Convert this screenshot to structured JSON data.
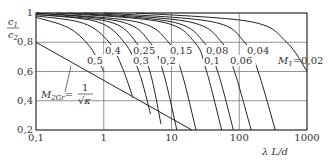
{
  "chart_data": {
    "type": "line",
    "title": "",
    "xlabel": "λ L/d",
    "ylabel": "c1/c2",
    "xscale": "log",
    "xlim": [
      0.1,
      1000
    ],
    "ylim": [
      0.2,
      1.0
    ],
    "grid": true,
    "x_ticks": [
      "0,1",
      "1",
      "10",
      "100",
      "1000"
    ],
    "y_ticks": [
      "0,2",
      "0,4",
      "0,6",
      "0,8",
      "1"
    ],
    "boundary_line": {
      "name": "M2Gr = 1/√κ",
      "points": [
        [
          0.1,
          0.8
        ],
        [
          20,
          0.2
        ]
      ]
    },
    "series": [
      {
        "name": "0,5",
        "M1": 0.5,
        "points": [
          [
            0.1,
            0.97
          ],
          [
            0.3,
            0.9
          ],
          [
            0.6,
            0.78
          ],
          [
            0.9,
            0.64
          ],
          [
            1.0,
            0.6
          ]
        ]
      },
      {
        "name": "0,4",
        "M1": 0.4,
        "points": [
          [
            0.1,
            0.98
          ],
          [
            0.5,
            0.93
          ],
          [
            1.2,
            0.8
          ],
          [
            1.9,
            0.62
          ],
          [
            2.7,
            0.42
          ]
        ]
      },
      {
        "name": "0,3",
        "M1": 0.3,
        "points": [
          [
            0.1,
            0.99
          ],
          [
            0.8,
            0.94
          ],
          [
            2.0,
            0.8
          ],
          [
            3.3,
            0.6
          ],
          [
            4.9,
            0.31
          ]
        ]
      },
      {
        "name": "0,25",
        "M1": 0.25,
        "points": [
          [
            0.1,
            0.99
          ],
          [
            1.2,
            0.94
          ],
          [
            3.0,
            0.8
          ],
          [
            4.8,
            0.6
          ],
          [
            7.0,
            0.24
          ]
        ]
      },
      {
        "name": "0,2",
        "M1": 0.2,
        "points": [
          [
            0.1,
            1.0
          ],
          [
            1.8,
            0.94
          ],
          [
            4.8,
            0.8
          ],
          [
            7.5,
            0.6
          ],
          [
            12,
            0.2
          ]
        ]
      },
      {
        "name": "0,15",
        "M1": 0.15,
        "points": [
          [
            0.1,
            1.0
          ],
          [
            3.0,
            0.94
          ],
          [
            9.0,
            0.8
          ],
          [
            14,
            0.6
          ],
          [
            23,
            0.2
          ]
        ]
      },
      {
        "name": "0,1",
        "M1": 0.1,
        "points": [
          [
            0.2,
            1.0
          ],
          [
            7.0,
            0.94
          ],
          [
            22,
            0.8
          ],
          [
            33,
            0.6
          ],
          [
            55,
            0.2
          ]
        ]
      },
      {
        "name": "0,08",
        "M1": 0.08,
        "points": [
          [
            0.3,
            1.0
          ],
          [
            10,
            0.94
          ],
          [
            30,
            0.8
          ],
          [
            48,
            0.6
          ],
          [
            82,
            0.2
          ]
        ]
      },
      {
        "name": "0,06",
        "M1": 0.06,
        "points": [
          [
            0.5,
            1.0
          ],
          [
            18,
            0.94
          ],
          [
            55,
            0.8
          ],
          [
            85,
            0.6
          ],
          [
            150,
            0.2
          ]
        ]
      },
      {
        "name": "0,04",
        "M1": 0.04,
        "points": [
          [
            1.0,
            1.0
          ],
          [
            40,
            0.94
          ],
          [
            120,
            0.8
          ],
          [
            190,
            0.6
          ],
          [
            340,
            0.2
          ]
        ]
      },
      {
        "name": "M1=0,02",
        "M1": 0.02,
        "points": [
          [
            3.0,
            1.0
          ],
          [
            150,
            0.94
          ],
          [
            500,
            0.8
          ],
          [
            1000,
            0.6
          ]
        ]
      }
    ],
    "annotations": [
      "M2Gr = 1/√κ",
      "M1 = 0,02"
    ]
  },
  "labels": {
    "y_axis_num": "c",
    "y_axis_num_sub": "1",
    "y_axis_den": "c",
    "y_axis_den_sub": "2",
    "x_axis": "λ L/d",
    "m2gr_lhs": "M",
    "m2gr_sub": "2Gr",
    "m2gr_eq": "=",
    "m2gr_num": "1",
    "m2gr_den": "√κ",
    "m1_prefix": "M",
    "m1_sub": "1",
    "m1_eq": "=0,02"
  }
}
